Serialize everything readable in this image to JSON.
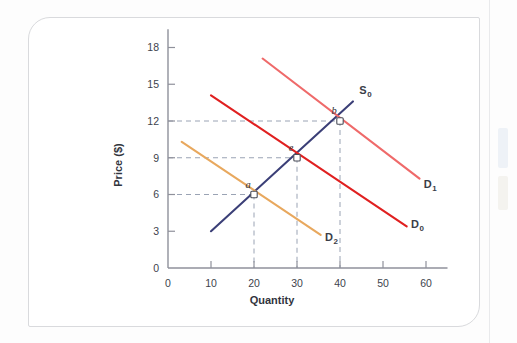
{
  "figure": {
    "background_color": "#ffffff",
    "card_border_color": "#d9dadd"
  },
  "chart_data": {
    "type": "line",
    "title": "",
    "xlabel": "Quantity",
    "ylabel": "Price ($)",
    "xlim": [
      0,
      65
    ],
    "ylim": [
      0,
      19.5
    ],
    "xticks": [
      0,
      10,
      20,
      30,
      40,
      50,
      60
    ],
    "xtick_labels": [
      "0",
      "10",
      "20",
      "30",
      "40",
      "50",
      "60"
    ],
    "yticks": [
      0,
      3,
      6,
      9,
      12,
      15,
      18
    ],
    "ytick_labels": [
      "0",
      "3",
      "6",
      "9",
      "12",
      "15",
      "18"
    ],
    "grid": false,
    "legend": "inline-curve-labels",
    "series": [
      {
        "name": "S0",
        "label": "S",
        "label_sub": "0",
        "color": "#3b3f77",
        "kind": "supply",
        "points": [
          [
            10,
            3
          ],
          [
            43,
            13.6
          ]
        ],
        "label_pos": [
          44.5,
          14.2
        ]
      },
      {
        "name": "D0",
        "label": "D",
        "label_sub": "0",
        "color": "#e02020",
        "kind": "demand",
        "points": [
          [
            10,
            14.1
          ],
          [
            55.5,
            3.4
          ]
        ],
        "label_pos": [
          56.5,
          3.3
        ]
      },
      {
        "name": "D1",
        "label": "D",
        "label_sub": "1",
        "color": "#ef6a6a",
        "kind": "demand",
        "points": [
          [
            22,
            17.1
          ],
          [
            58.5,
            7.3
          ]
        ],
        "label_pos": [
          59.5,
          6.5
        ]
      },
      {
        "name": "D2",
        "label": "D",
        "label_sub": "2",
        "color": "#e8a85e",
        "kind": "demand",
        "points": [
          [
            3.2,
            10.3
          ],
          [
            35.5,
            2.7
          ]
        ],
        "label_pos": [
          36.5,
          2.2
        ]
      }
    ],
    "annotated_points": [
      {
        "name": "a",
        "label": "a",
        "x": 20,
        "y": 6,
        "label_dx": -6,
        "label_dy": -7
      },
      {
        "name": "e",
        "label": "e",
        "x": 30,
        "y": 9,
        "label_dx": -6,
        "label_dy": -7
      },
      {
        "name": "b",
        "label": "b",
        "x": 40,
        "y": 12,
        "label_dx": -6,
        "label_dy": -7
      }
    ],
    "guide_lines": [
      {
        "from_point": "a",
        "to": "both-axes"
      },
      {
        "from_point": "e",
        "to": "both-axes"
      },
      {
        "from_point": "b",
        "to": "both-axes"
      }
    ]
  }
}
